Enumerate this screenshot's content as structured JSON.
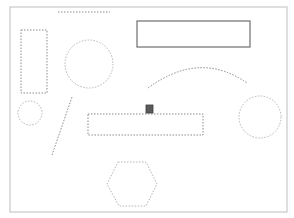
{
  "canvas": {
    "width": 294,
    "height": 218,
    "background": "#ffffff",
    "frame": {
      "x": 10,
      "y": 7,
      "width": 277,
      "height": 205,
      "stroke": "#c8c8c8"
    }
  },
  "colors": {
    "dashed_stroke": "#8a8a8a",
    "light_dashed_stroke": "#b5b5b5",
    "solid_stroke": "#6e6e6e",
    "handle_fill": "#5a5a5a"
  },
  "shapes": {
    "top_dashed_line": {
      "type": "line",
      "style": "dashed",
      "x1": 58,
      "y1": 12,
      "x2": 110,
      "y2": 12
    },
    "tall_dashed_rect": {
      "type": "rect",
      "style": "dashed",
      "x": 21,
      "y": 30,
      "width": 26,
      "height": 63
    },
    "large_left_circle": {
      "type": "circle",
      "style": "dashed-light",
      "cx": 89,
      "cy": 64,
      "r": 24
    },
    "solid_rect": {
      "type": "rect",
      "style": "solid",
      "x": 137,
      "y": 21,
      "width": 113,
      "height": 26
    },
    "arc": {
      "type": "path",
      "style": "dashed",
      "d": "M148 88 Q 200 50 247 83"
    },
    "small_left_circle": {
      "type": "circle",
      "style": "dashed-light",
      "cx": 30,
      "cy": 113,
      "r": 12
    },
    "diagonal_line": {
      "type": "line",
      "style": "dashed",
      "x1": 72,
      "y1": 97,
      "x2": 52,
      "y2": 155
    },
    "wide_dashed_rect": {
      "type": "rect",
      "style": "dashed",
      "x": 88,
      "y": 114,
      "width": 115,
      "height": 21
    },
    "selection_handle": {
      "type": "rect",
      "style": "handle",
      "x": 146,
      "y": 105,
      "width": 7,
      "height": 8
    },
    "right_circle": {
      "type": "circle",
      "style": "dashed-light",
      "cx": 260,
      "cy": 117,
      "r": 21
    },
    "hexagon": {
      "type": "polygon",
      "style": "dashed-light",
      "points": "118,162 146,162 157,184 146,206 119,206 107,184"
    }
  }
}
